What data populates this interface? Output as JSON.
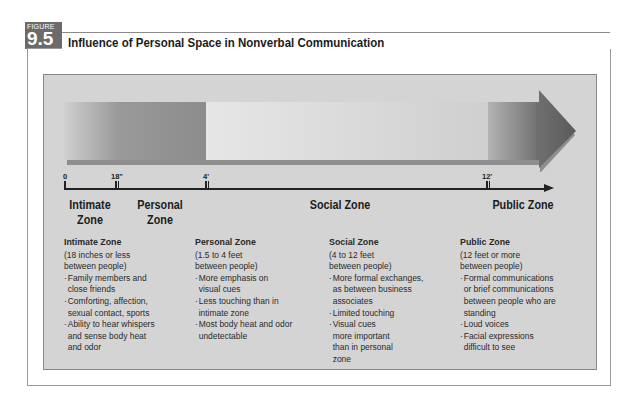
{
  "figure": {
    "label_word": "FIGURE",
    "number": "9.5",
    "title": "Influence of Personal Space in Nonverbal Communication"
  },
  "axis": {
    "ticks": [
      {
        "label": "0"
      },
      {
        "label": "18\""
      },
      {
        "label": "4'"
      },
      {
        "label": "12'"
      }
    ]
  },
  "zone_headings": {
    "intimate": [
      "Intimate",
      "Zone"
    ],
    "personal": [
      "Personal",
      "Zone"
    ],
    "social": "Social Zone",
    "public": "Public Zone"
  },
  "zones": [
    {
      "heading": "Intimate Zone",
      "range": [
        "(18 inches or less",
        "between people)"
      ],
      "bullets": [
        "Family members and close friends",
        "Comforting, affection, sexual contact, sports",
        "Ability to hear whispers and sense body heat and odor"
      ]
    },
    {
      "heading": "Personal Zone",
      "range": [
        "(1.5 to 4 feet",
        "between people)"
      ],
      "bullets": [
        "More emphasis on visual cues",
        "Less touching than in intimate zone",
        "Most body heat and odor undetectable"
      ]
    },
    {
      "heading": "Social Zone",
      "range": [
        "(4 to 12 feet",
        "between people)"
      ],
      "bullets": [
        "More formal exchanges, as between business associates",
        "Limited touching",
        "Visual cues more important than in personal zone"
      ]
    },
    {
      "heading": "Public Zone",
      "range": [
        "(12 feet or more",
        "between people)"
      ],
      "bullets": [
        "Formal communications or brief communications between people who are standing",
        "Loud voices",
        "Facial expressions difficult to see"
      ]
    }
  ]
}
